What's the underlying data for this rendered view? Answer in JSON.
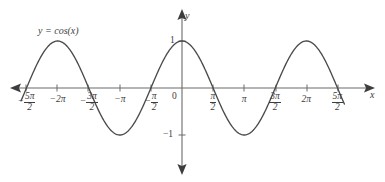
{
  "chart_data": {
    "type": "line",
    "title": "",
    "function_label": "y = cos(x)",
    "expression": "cos(x)",
    "xlabel": "x",
    "ylabel": "y",
    "xlim": [
      -8.2,
      8.2
    ],
    "ylim": [
      -1.45,
      1.5
    ],
    "grid": false,
    "legend": "none",
    "amplitude": 1,
    "period": "2π",
    "x_tick_values": [
      -7.854,
      -6.283,
      -4.712,
      -3.142,
      -1.571,
      0,
      1.571,
      3.142,
      4.712,
      6.283,
      7.854
    ],
    "x_tick_labels": [
      {
        "sign": "-",
        "num": "5π",
        "den": "2",
        "type": "fraction"
      },
      {
        "sign": "-",
        "text": "2π",
        "type": "plain"
      },
      {
        "sign": "-",
        "num": "3π",
        "den": "2",
        "type": "fraction"
      },
      {
        "sign": "-",
        "text": "π",
        "type": "plain"
      },
      {
        "sign": "-",
        "num": "π",
        "den": "2",
        "type": "fraction"
      },
      {
        "sign": "",
        "text": "0",
        "type": "origin"
      },
      {
        "sign": "",
        "num": "π",
        "den": "2",
        "type": "fraction"
      },
      {
        "sign": "",
        "text": "π",
        "type": "plain"
      },
      {
        "sign": "",
        "num": "3π",
        "den": "2",
        "type": "fraction"
      },
      {
        "sign": "",
        "text": "2π",
        "type": "plain"
      },
      {
        "sign": "",
        "num": "5π",
        "den": "2",
        "type": "fraction"
      }
    ],
    "y_tick_values": [
      1,
      -1
    ],
    "y_tick_labels": [
      "1",
      "−1"
    ],
    "maxima_x": [
      "-2π",
      "0",
      "2π"
    ],
    "minima_x": [
      "-π",
      "π"
    ],
    "zeros_x": [
      "-5π/2",
      "-3π/2",
      "-π/2",
      "π/2",
      "3π/2",
      "5π/2"
    ],
    "curve_color": "#4a4a4a",
    "axis_color": "#6b6b6b",
    "background_color": "#ffffff"
  },
  "labels": {
    "function": "y = cos(x)",
    "x_axis": "x",
    "y_axis": "y",
    "origin": "0",
    "y_pos_one": "1",
    "y_neg_one": "−1"
  }
}
